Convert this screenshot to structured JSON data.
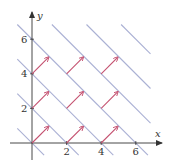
{
  "figure": {
    "axes": {
      "x_label": "x",
      "y_label": "y",
      "x_ticks": [
        "2",
        "4",
        "6"
      ],
      "y_ticks": [
        "2",
        "4",
        "6"
      ]
    },
    "colors": {
      "level_lines": "#aab0d4",
      "arrows": "#c4506f",
      "axes": "#333333"
    },
    "level_lines_c": [
      0,
      2,
      4,
      6,
      8,
      10,
      12
    ],
    "arrows": [
      {
        "x": 0,
        "y": 0
      },
      {
        "x": 2,
        "y": 0
      },
      {
        "x": 4,
        "y": 0
      },
      {
        "x": 0,
        "y": 2
      },
      {
        "x": 2,
        "y": 2
      },
      {
        "x": 4,
        "y": 2
      },
      {
        "x": 0,
        "y": 4
      },
      {
        "x": 2,
        "y": 4
      },
      {
        "x": 4,
        "y": 4
      }
    ],
    "arrow_vector": {
      "dx": 0.95,
      "dy": 0.95
    }
  }
}
